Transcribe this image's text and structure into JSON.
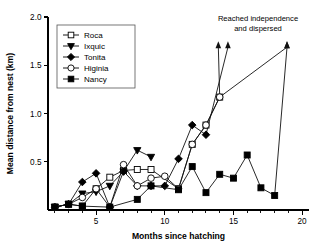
{
  "chart_data": {
    "type": "line",
    "title": "",
    "xlabel": "Months since hatching",
    "ylabel": "Mean distance from nest (km)",
    "xlim": [
      1.5,
      20.5
    ],
    "ylim": [
      0.0,
      2.0
    ],
    "x_ticks": [
      5,
      10,
      15,
      20
    ],
    "x_tick_labels": [
      "5",
      "10",
      "15",
      "20"
    ],
    "x_minor_ticks": [
      2,
      3,
      4,
      6,
      7,
      8,
      9,
      11,
      12,
      13,
      14,
      16,
      17,
      18,
      19
    ],
    "y_ticks": [
      0.5,
      1.0,
      1.5,
      2.0
    ],
    "y_tick_labels": [
      "0.5",
      "1.0",
      "1.5",
      "2.0"
    ],
    "grid": false,
    "legend_position": "upper-left-inside",
    "annotations": [
      {
        "text_line1": "Reached independence",
        "text_line2": "and dispersed",
        "arrows_at_x": [
          13.9,
          14.6,
          18.9
        ],
        "arrow_top_y": 1.75
      }
    ],
    "series": [
      {
        "name": "Roca",
        "marker": "open-square",
        "x": [
          2,
          3,
          4,
          5,
          6,
          7,
          8,
          9,
          11,
          12,
          13,
          14
        ],
        "values": [
          0.03,
          0.06,
          0.04,
          0.22,
          0.34,
          0.41,
          0.42,
          0.42,
          0.22,
          0.68,
          0.88,
          1.17
        ],
        "ends_with_arrow": true
      },
      {
        "name": "Ixquic",
        "marker": "filled-triangle-down",
        "x": [
          2,
          3,
          4,
          5,
          6,
          7,
          8,
          9
        ],
        "values": [
          0.03,
          0.06,
          0.17,
          0.19,
          0.25,
          0.4,
          0.62,
          0.55
        ],
        "ends_with_arrow": false
      },
      {
        "name": "Tonita",
        "marker": "filled-diamond",
        "x": [
          2,
          3,
          4,
          5,
          6,
          7,
          8,
          9,
          10,
          11,
          12,
          13
        ],
        "values": [
          0.03,
          0.06,
          0.29,
          0.38,
          0.03,
          0.4,
          0.25,
          0.25,
          0.25,
          0.53,
          0.88,
          0.78
        ],
        "ends_with_arrow": true
      },
      {
        "name": "Higinia",
        "marker": "open-circle",
        "x": [
          2,
          3,
          4,
          5,
          6,
          7,
          8,
          9,
          10,
          11,
          12,
          13,
          14
        ],
        "values": [
          0.03,
          0.06,
          0.13,
          0.22,
          0.03,
          0.47,
          0.25,
          0.33,
          0.35,
          0.22,
          0.68,
          0.88,
          1.17
        ],
        "ends_with_arrow": true
      },
      {
        "name": "Nancy",
        "marker": "filled-square",
        "x": [
          2,
          3,
          4,
          6,
          8,
          9,
          11,
          12,
          13,
          14,
          15,
          16,
          17,
          18
        ],
        "values": [
          0.03,
          0.06,
          0.04,
          0.03,
          0.11,
          0.25,
          0.21,
          0.45,
          0.18,
          0.37,
          0.33,
          0.57,
          0.23,
          0.15
        ],
        "ends_with_arrow": true
      }
    ]
  },
  "legend": {
    "entries": [
      {
        "label": "Roca"
      },
      {
        "label": "Ixquic"
      },
      {
        "label": "Tonita"
      },
      {
        "label": "Higinia"
      },
      {
        "label": "Nancy"
      }
    ]
  },
  "axes": {
    "x_title": "Months since hatching",
    "y_title": "Mean distance from nest (km)",
    "x_tick_labels": [
      "5",
      "10",
      "15",
      "20"
    ],
    "y_tick_labels": [
      "0.5",
      "1.0",
      "1.5",
      "2.0"
    ]
  },
  "annotation": {
    "line1": "Reached independence",
    "line2": "and dispersed"
  }
}
